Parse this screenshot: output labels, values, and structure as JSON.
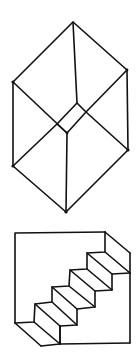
{
  "figures": [
    {
      "name": "necker-cube",
      "description": "Ambiguous wireframe cube drawing",
      "stroke_color": "#111111",
      "vertices": {
        "top": [
          73,
          22
        ],
        "upper_left": [
          13,
          82
        ],
        "upper_right": [
          127,
          70
        ],
        "inner_top": [
          77,
          103
        ],
        "inner_bottom": [
          67,
          133
        ],
        "lower_left": [
          13,
          166
        ],
        "lower_right": [
          128,
          150
        ],
        "bottom": [
          66,
          212
        ]
      }
    },
    {
      "name": "schroeder-staircase",
      "description": "Reversible staircase illusion drawing",
      "stroke_color": "#111111",
      "steps": 5
    }
  ]
}
